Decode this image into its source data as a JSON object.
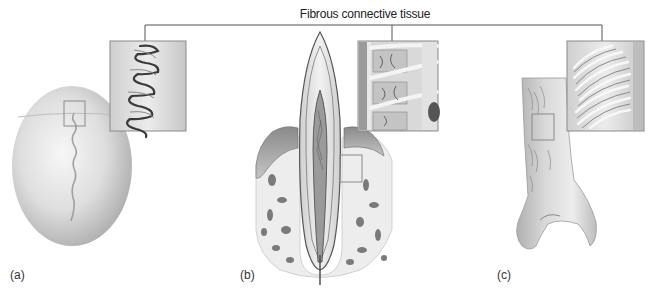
{
  "figure": {
    "title": "Fibrous connective tissue",
    "panels": [
      {
        "id": "a",
        "label": "(a)",
        "subject": "skull-suture",
        "description": "Suture between skull bones, with magnified inset of interlocking suture"
      },
      {
        "id": "b",
        "label": "(b)",
        "subject": "tooth-gomphosis",
        "description": "Tooth in socket (gomphosis), with magnified inset of periodontal ligament"
      },
      {
        "id": "c",
        "label": "(c)",
        "subject": "bone-syndesmosis",
        "description": "Distal bone shaft (syndesmosis), with magnified inset of ligament fibers"
      }
    ],
    "colors": {
      "background": "#ffffff",
      "connector_line": "#555555",
      "inset_border": "#8a8a8a",
      "bone_light": "#e6e6e6",
      "bone_shade": "#b5b5b5",
      "text": "#222222"
    }
  }
}
